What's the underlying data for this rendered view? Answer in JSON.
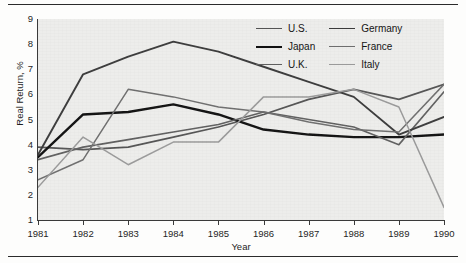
{
  "figure": {
    "rule_color": "#2b2b2b",
    "plot_background": "#ededeb"
  },
  "axes": {
    "y_title": "Real Return, %",
    "x_title": "Year",
    "y_ticks": [
      "1",
      "2",
      "3",
      "4",
      "5",
      "6",
      "7",
      "8",
      "9"
    ],
    "x_ticks": [
      "1981",
      "1982",
      "1983",
      "1984",
      "1985",
      "1986",
      "1987",
      "1988",
      "1989",
      "1990"
    ]
  },
  "legend": {
    "items": [
      {
        "label": "U.S.",
        "color": "#545454",
        "width": 1.7
      },
      {
        "label": "Germany",
        "color": "#3b3b3b",
        "width": 1.9
      },
      {
        "label": "Japan",
        "color": "#111111",
        "width": 2.4
      },
      {
        "label": "France",
        "color": "#6e6e6e",
        "width": 1.5
      },
      {
        "label": "U.K.",
        "color": "#5f5f5f",
        "width": 1.6
      },
      {
        "label": "Italy",
        "color": "#9a9a9a",
        "width": 1.5
      }
    ]
  },
  "chart_data": {
    "type": "line",
    "title": "",
    "xlabel": "Year",
    "ylabel": "Real Return, %",
    "x": [
      1981,
      1982,
      1983,
      1984,
      1985,
      1986,
      1987,
      1988,
      1989,
      1990
    ],
    "categories": [
      "1981",
      "1982",
      "1983",
      "1984",
      "1985",
      "1986",
      "1987",
      "1988",
      "1989",
      "1990"
    ],
    "xlim": [
      1981,
      1990
    ],
    "ylim": [
      1,
      9
    ],
    "grid": false,
    "legend_position": "top-right",
    "series": [
      {
        "name": "U.S.",
        "color": "#545454",
        "width": 1.7,
        "values": [
          3.9,
          3.8,
          3.9,
          4.3,
          4.7,
          5.2,
          5.8,
          6.2,
          5.8,
          6.4
        ]
      },
      {
        "name": "Japan",
        "color": "#111111",
        "width": 2.4,
        "values": [
          3.5,
          5.2,
          5.3,
          5.6,
          5.2,
          4.6,
          4.4,
          4.3,
          4.3,
          4.4
        ]
      },
      {
        "name": "U.K.",
        "color": "#5f5f5f",
        "width": 1.6,
        "values": [
          3.4,
          3.9,
          4.2,
          4.5,
          4.8,
          5.3,
          5.0,
          4.7,
          4.0,
          6.1
        ]
      },
      {
        "name": "Germany",
        "color": "#3b3b3b",
        "width": 1.9,
        "values": [
          3.6,
          6.8,
          7.5,
          8.1,
          7.7,
          7.1,
          6.5,
          5.9,
          4.4,
          5.1
        ]
      },
      {
        "name": "France",
        "color": "#6e6e6e",
        "width": 1.5,
        "values": [
          2.6,
          3.4,
          6.2,
          5.9,
          5.5,
          5.3,
          4.9,
          4.6,
          4.5,
          6.4
        ]
      },
      {
        "name": "Italy",
        "color": "#9a9a9a",
        "width": 1.5,
        "values": [
          2.3,
          4.3,
          3.2,
          4.1,
          4.1,
          5.9,
          5.9,
          6.2,
          5.5,
          1.5
        ]
      }
    ]
  }
}
